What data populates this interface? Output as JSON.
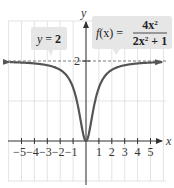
{
  "chart_data": {
    "type": "line",
    "title": "",
    "function_label": {
      "lhs": "f(x) =",
      "numerator": "4x²",
      "denominator": "2x² + 1"
    },
    "asymptote_label": "y = 2",
    "asymptote_value": 2,
    "xlabel": "x",
    "ylabel": "y",
    "xlim": [
      -5.8,
      5.8
    ],
    "ylim": [
      -1,
      3
    ],
    "x_ticks": [
      -5,
      -4,
      -3,
      -2,
      -1,
      1,
      2,
      3,
      4,
      5
    ],
    "x_tick_labels": [
      "−5",
      "−4",
      "−3",
      "−2",
      "−1",
      "1",
      "2",
      "3",
      "4",
      "5"
    ],
    "y_ticks": [
      2
    ],
    "y_tick_labels": [
      "2"
    ],
    "grid": true,
    "series": [
      {
        "name": "f(x) = 4x²/(2x²+1)",
        "x": [
          -5.8,
          -5,
          -4,
          -3,
          -2,
          -1.5,
          -1,
          -0.75,
          -0.5,
          -0.25,
          0,
          0.25,
          0.5,
          0.75,
          1,
          1.5,
          2,
          3,
          4,
          5,
          5.8
        ],
        "y": [
          1.97,
          1.96,
          1.94,
          1.89,
          1.78,
          1.64,
          1.33,
          1.06,
          0.67,
          0.22,
          0,
          0.22,
          0.67,
          1.06,
          1.33,
          1.64,
          1.78,
          1.89,
          1.94,
          1.96,
          1.97
        ],
        "color": "#555555"
      }
    ]
  },
  "labels": {
    "x_axis": "x",
    "y_axis": "y",
    "y_tick_2": "2",
    "asymptote": {
      "y": "y",
      "eq": " = ",
      "val": "2"
    },
    "function": {
      "lhs_f": "f",
      "lhs_rest": "(x) =",
      "num": "4x",
      "num_exp": "2",
      "den_a": "2x",
      "den_exp": "2",
      "den_b": " + 1"
    },
    "x_ticks": [
      "−5",
      "−4",
      "−3",
      "−2",
      "−1",
      "1",
      "2",
      "3",
      "4",
      "5"
    ]
  },
  "colors": {
    "curve": "#555555",
    "grid": "#dcdcdc",
    "axis": "#333333",
    "callout_bg": "#e6e6e6"
  }
}
